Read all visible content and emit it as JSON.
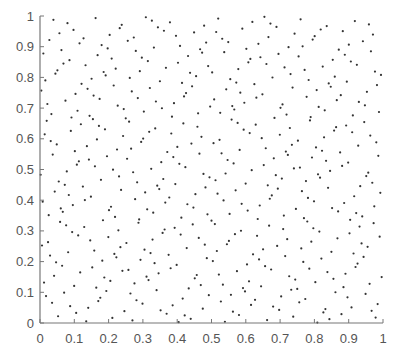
{
  "chart_data": {
    "type": "scatter",
    "title": "",
    "xlabel": "",
    "ylabel": "",
    "xlim": [
      0,
      1
    ],
    "ylim": [
      0,
      1
    ],
    "grid": false,
    "legend": null,
    "x_ticks": [
      "0",
      "0.1",
      "0.2",
      "0.3",
      "0.4",
      "0.5",
      "0.6",
      "0.7",
      "0.8",
      "0.9",
      "1"
    ],
    "y_ticks": [
      "0",
      "0.1",
      "0.2",
      "0.3",
      "0.4",
      "0.5",
      "0.6",
      "0.7",
      "0.8",
      "0.9",
      "1"
    ],
    "point_count_approx": 500,
    "point_style": {
      "shape": "dot",
      "radius": 1.1,
      "color": "#333333"
    },
    "series": [
      {
        "name": "points",
        "generator": {
          "kind": "halton",
          "bases": [
            2,
            3
          ],
          "start_index": 1,
          "count": 500
        },
        "points_sample": [
          [
            0.5,
            0.3333
          ],
          [
            0.25,
            0.6667
          ],
          [
            0.75,
            0.1111
          ],
          [
            0.125,
            0.4444
          ],
          [
            0.625,
            0.7778
          ],
          [
            0.375,
            0.2222
          ],
          [
            0.875,
            0.5556
          ],
          [
            0.0625,
            0.8889
          ],
          [
            0.5625,
            0.037
          ],
          [
            0.3125,
            0.3704
          ],
          [
            0.8125,
            0.7037
          ],
          [
            0.1875,
            0.1481
          ],
          [
            0.6875,
            0.4815
          ],
          [
            0.4375,
            0.8148
          ],
          [
            0.9375,
            0.2593
          ],
          [
            0.0313,
            0.5926
          ],
          [
            0.5313,
            0.9259
          ],
          [
            0.2813,
            0.0741
          ],
          [
            0.7813,
            0.4074
          ],
          [
            0.1563,
            0.7407
          ]
        ]
      }
    ]
  },
  "colors": {
    "axis": "#777777",
    "text": "#555555",
    "point": "#333333",
    "background": "#ffffff"
  }
}
